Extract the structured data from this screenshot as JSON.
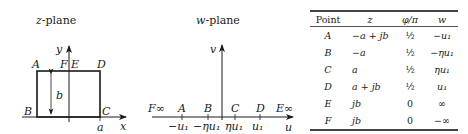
{
  "z_plane": {
    "title_var": "z",
    "title_rest": "-plane",
    "axis_x_label": "x",
    "axis_y_label": "y",
    "corner_labels": [
      "A",
      "F",
      "E",
      "D",
      "B",
      "C"
    ],
    "height_label": "b",
    "width_label": "a"
  },
  "w_plane": {
    "title_var": "w",
    "title_rest": "-plane",
    "axis_u_label": "u",
    "axis_v_label": "v",
    "point_labels": [
      "F∞",
      "A",
      "B",
      "C",
      "D",
      "E∞"
    ],
    "tick_labels": [
      "−u₁",
      "−ηu₁",
      "ηu₁",
      "u₁"
    ]
  },
  "table": {
    "headers": [
      "Point",
      "z",
      "φ/π",
      "w"
    ],
    "rows": [
      {
        "point": "A",
        "z": "−a + jb",
        "phi": "½",
        "w": "−u₁"
      },
      {
        "point": "B",
        "z": "−a",
        "phi": "½",
        "w": "−ηu₁"
      },
      {
        "point": "C",
        "z": "a",
        "phi": "½",
        "w": "ηu₁"
      },
      {
        "point": "D",
        "z": "a + jb",
        "phi": "½",
        "w": "u₁"
      },
      {
        "point": "E",
        "z": "jb",
        "phi": "0",
        "w": "∞"
      },
      {
        "point": "F",
        "z": "jb",
        "phi": "0",
        "w": "−∞"
      }
    ]
  }
}
